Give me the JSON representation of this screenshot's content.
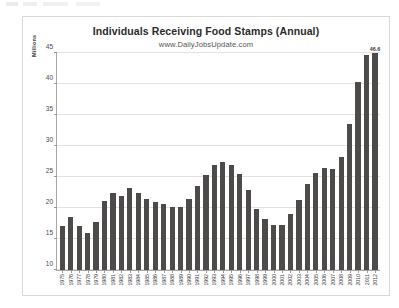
{
  "chart": {
    "title": "Individuals Receiving Food Stamps (Annual)",
    "subtitle": "www.DailyJobsUpdate.com",
    "yaxis_title": "Millions",
    "bar_color": "#4d4b49",
    "grid_color": "#e2e2e2",
    "frame_color": "#d9d9d9"
  },
  "chart_data": {
    "type": "bar",
    "title": "Individuals Receiving Food Stamps (Annual)",
    "subtitle": "www.DailyJobsUpdate.com",
    "xlabel": "",
    "ylabel": "Millions",
    "ylim": [
      10,
      45
    ],
    "yticks": [
      10,
      15,
      20,
      25,
      30,
      35,
      40,
      45
    ],
    "grid": true,
    "legend": "none",
    "annotations": [
      {
        "category": "2012",
        "text": "46.6",
        "position": "above-bar"
      }
    ],
    "categories": [
      "1975",
      "1976",
      "1977",
      "1978",
      "1979",
      "1980",
      "1981",
      "1982",
      "1983",
      "1984",
      "1985",
      "1986",
      "1987",
      "1988",
      "1989",
      "1990",
      "1991",
      "1992",
      "1993",
      "1994",
      "1995",
      "1996",
      "1997",
      "1998",
      "1999",
      "2000",
      "2001",
      "2002",
      "2003",
      "2004",
      "2005",
      "2006",
      "2007",
      "2008",
      "2009",
      "2010",
      "2011",
      "2012"
    ],
    "values": [
      17.1,
      18.5,
      17.1,
      16.0,
      17.7,
      21.1,
      22.4,
      22.0,
      23.2,
      22.4,
      21.4,
      20.9,
      20.6,
      20.1,
      20.1,
      21.5,
      23.6,
      25.4,
      27.0,
      27.5,
      27.0,
      25.5,
      22.9,
      19.8,
      18.2,
      17.2,
      17.3,
      19.1,
      21.3,
      23.9,
      25.7,
      26.5,
      26.3,
      28.2,
      33.5,
      40.3,
      44.7,
      46.6
    ]
  }
}
